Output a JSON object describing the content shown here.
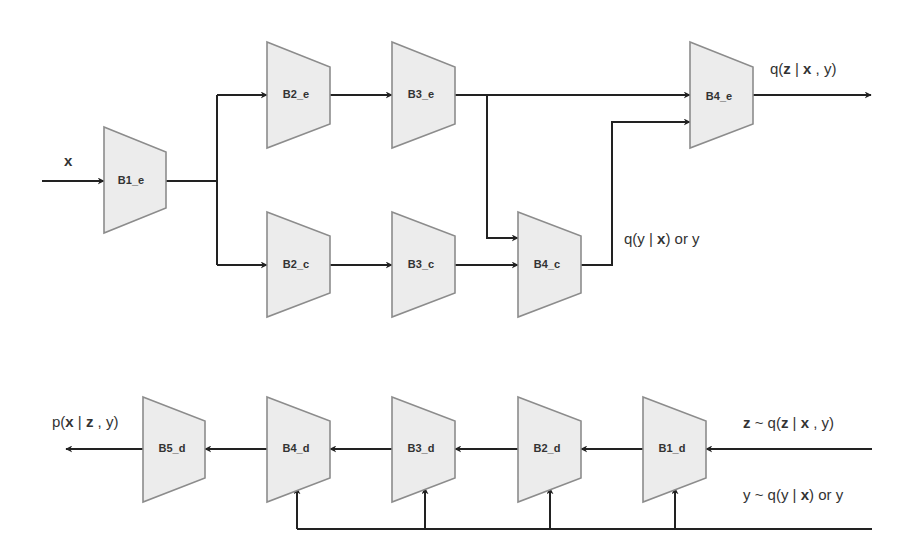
{
  "diagram": {
    "type": "neural-network-block-diagram",
    "colors": {
      "block_fill": "#ececec",
      "block_stroke": "#8c8c8c",
      "wire": "#222222",
      "text": "#333333"
    },
    "input_label": "x",
    "encoder": {
      "blocks": {
        "b1_e": "B1_e",
        "b2_e": "B2_e",
        "b3_e": "B3_e",
        "b4_e": "B4_e"
      },
      "output_label": {
        "pre": "q(",
        "z": "z",
        "mid": " | ",
        "x": "x",
        "post": " , y)"
      }
    },
    "classifier": {
      "blocks": {
        "b2_c": "B2_c",
        "b3_c": "B3_c",
        "b4_c": "B4_c"
      },
      "output_label": {
        "pre": "q(y | ",
        "x": "x",
        "post": ") or y"
      }
    },
    "decoder": {
      "blocks": {
        "b1_d": "B1_d",
        "b2_d": "B2_d",
        "b3_d": "B3_d",
        "b4_d": "B4_d",
        "b5_d": "B5_d"
      },
      "z_input_label": {
        "z1": "z",
        "mid1": " ~ q(",
        "z2": "z",
        "mid2": " | ",
        "x": "x",
        "post": " , y)"
      },
      "y_input_label": {
        "pre": "y ~ q(y | ",
        "x": "x",
        "post": ") or y"
      },
      "output_label": {
        "pre": "p(",
        "x": "x",
        "mid": " | ",
        "z": "z",
        "post": " , y)"
      }
    }
  }
}
